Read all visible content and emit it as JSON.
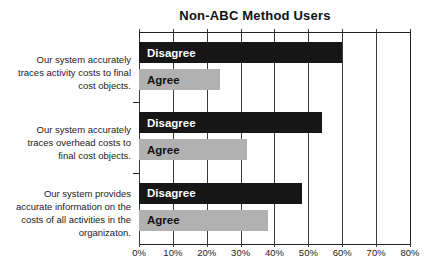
{
  "chart_data": {
    "type": "bar",
    "orientation": "horizontal",
    "title": "Non-ABC Method Users",
    "categories": [
      [
        "Our system accurately",
        "traces activity costs to final",
        "cost objects."
      ],
      [
        "Our system accurately",
        "traces overhead costs to",
        "final cost objects."
      ],
      [
        "Our system provides",
        "accurate information on the",
        "costs of all activities in the",
        "organizaton."
      ]
    ],
    "series": [
      {
        "name": "Disagree",
        "values": [
          60,
          54,
          48
        ],
        "color": "#161616",
        "label_color": "#ffffff"
      },
      {
        "name": "Agree",
        "values": [
          24,
          32,
          38
        ],
        "color": "#b1b1b1",
        "label_color": "#111111"
      }
    ],
    "x_ticks": [
      "0%",
      "10%",
      "20%",
      "30%",
      "40%",
      "50%",
      "60%",
      "70%",
      "80%"
    ],
    "xlim": [
      0,
      80
    ],
    "grid": true,
    "legend": "labels-inside-bars"
  },
  "colors": {
    "background": "#ffffff",
    "gridline": "#3a3a3a",
    "axis": "#222222",
    "text": "#222222"
  }
}
